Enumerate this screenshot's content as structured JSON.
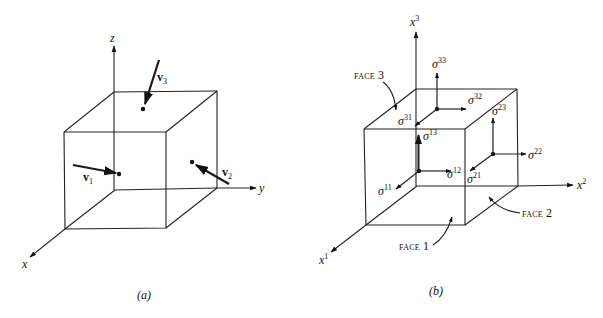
{
  "figure_a": {
    "caption_open": "(",
    "caption": "a",
    "caption_close": ")",
    "axes": {
      "z": "z",
      "y": "y",
      "x": "x"
    },
    "vectors": [
      {
        "name": "v",
        "sub": "1"
      },
      {
        "name": "v",
        "sub": "2"
      },
      {
        "name": "v",
        "sub": "3"
      }
    ]
  },
  "figure_b": {
    "caption_open": "(",
    "caption": "b",
    "caption_close": ")",
    "axes": {
      "x3": {
        "base": "x",
        "sup": "3"
      },
      "x2": {
        "base": "x",
        "sup": "2"
      },
      "x1": {
        "base": "x",
        "sup": "1"
      }
    },
    "faces": [
      {
        "label": "FACE",
        "num": "1"
      },
      {
        "label": "FACE",
        "num": "2"
      },
      {
        "label": "FACE",
        "num": "3"
      }
    ],
    "stresses": {
      "s11": {
        "base": "σ",
        "sup": "11"
      },
      "s12": {
        "base": "σ",
        "sup": "12"
      },
      "s13": {
        "base": "σ",
        "sup": "13"
      },
      "s21": {
        "base": "σ",
        "sup": "21"
      },
      "s22": {
        "base": "σ",
        "sup": "22"
      },
      "s23": {
        "base": "σ",
        "sup": "23"
      },
      "s31": {
        "base": "σ",
        "sup": "31"
      },
      "s32": {
        "base": "σ",
        "sup": "32"
      },
      "s33": {
        "base": "σ",
        "sup": "33"
      }
    }
  }
}
